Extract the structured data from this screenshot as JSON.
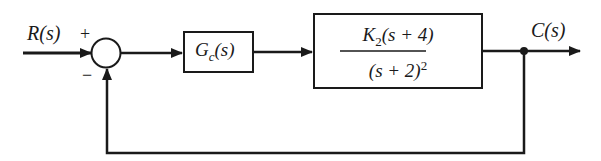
{
  "diagram": {
    "type": "feedback-control-block-diagram",
    "input": {
      "label": "R(s)"
    },
    "output": {
      "label": "C(s)"
    },
    "summing_junction": {
      "plus_sign": "+",
      "minus_sign": "−"
    },
    "blocks": [
      {
        "id": "controller",
        "label_main": "G",
        "label_sub": "c",
        "label_tail": "(s)"
      },
      {
        "id": "plant",
        "numerator_main": "K",
        "numerator_sub": "2",
        "numerator_tail": "(s + 4)",
        "denominator_main": "(s + 2)",
        "denominator_sup": "2"
      }
    ],
    "feedback": {
      "type": "unity",
      "sign": "negative"
    },
    "colors": {
      "line": "#1a1a1a",
      "background": "#ffffff"
    }
  }
}
